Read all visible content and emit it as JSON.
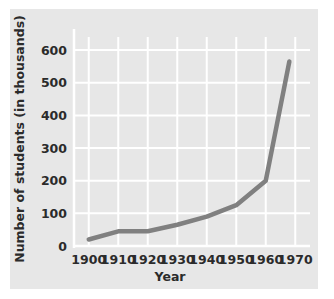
{
  "chart_data": {
    "type": "line",
    "title": "",
    "xlabel": "Year",
    "ylabel": "Number of students (in thousands)",
    "x": [
      1900,
      1910,
      1920,
      1930,
      1940,
      1950,
      1960,
      1968
    ],
    "values": [
      20,
      45,
      45,
      65,
      90,
      125,
      200,
      565
    ],
    "series": [
      {
        "name": "Number of students",
        "values": [
          20,
          45,
          45,
          65,
          90,
          125,
          200,
          565
        ]
      }
    ],
    "xlim": [
      1895,
      1975
    ],
    "ylim": [
      0,
      640
    ],
    "xticks": [
      1900,
      1910,
      1920,
      1930,
      1940,
      1950,
      1960,
      1970
    ],
    "yticks": [
      0,
      100,
      200,
      300,
      400,
      500,
      600
    ],
    "xtick_labels": [
      "1900",
      "1910",
      "1920",
      "1930",
      "1940",
      "1950",
      "1960",
      "1970"
    ],
    "ytick_labels": [
      "0",
      "100",
      "200",
      "300",
      "400",
      "500",
      "600"
    ],
    "grid": true,
    "legend": false,
    "legend_position": "none",
    "line_color": "#808080",
    "grid_color": "#ffffff",
    "panel_color": "#e7e7e7",
    "text_color": "#2b2b2b"
  }
}
